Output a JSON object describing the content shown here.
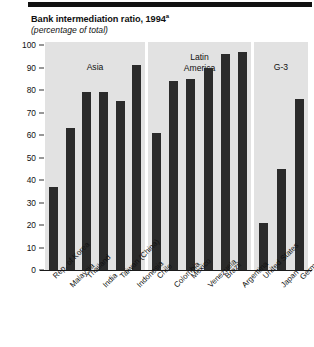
{
  "header": {
    "title": "Bank intermediation ratio, 1994",
    "title_superscript": "a",
    "subtitle": "(percentage of total)"
  },
  "chart_data": {
    "type": "bar",
    "title": "Bank intermediation ratio, 1994",
    "subtitle": "(percentage of total)",
    "xlabel": "",
    "ylabel": "",
    "ylim": [
      0,
      100
    ],
    "yticks": [
      "0",
      "10",
      "20",
      "30",
      "40",
      "50",
      "60",
      "70",
      "80",
      "90",
      "100"
    ],
    "grid": false,
    "legend": "none",
    "panels": [
      {
        "name": "Asia",
        "categories": [
          "Rep. of Korea",
          "Malaysia",
          "Thailand",
          "India",
          "Taiwan (China)",
          "Indonesia"
        ],
        "values": [
          37,
          63,
          79,
          79,
          75,
          91
        ]
      },
      {
        "name": "Latin America",
        "name_line1": "Latin",
        "name_line2": "America",
        "categories": [
          "Chile",
          "Colombia",
          "Mexico",
          "Venezuela",
          "Brazil",
          "Argentina"
        ],
        "values": [
          61,
          84,
          85,
          90,
          96,
          97
        ]
      },
      {
        "name": "G-3",
        "categories": [
          "United States",
          "Japan",
          "Germany"
        ],
        "category_superscripts": [
          "",
          "",
          "b"
        ],
        "values": [
          21,
          45,
          76
        ]
      }
    ]
  }
}
